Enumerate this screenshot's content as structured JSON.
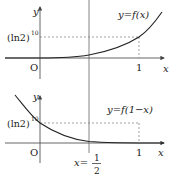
{
  "top_graph": {
    "curve_label": "y=f(x)",
    "y_axis_label": "y",
    "x_axis_label": "x",
    "origin_label": "O",
    "x_tick_label": "1",
    "y_tick_label_base": "(ln2)",
    "y_tick_label_exp": "10"
  },
  "bottom_graph": {
    "curve_label": "y=f(1−x)",
    "y_axis_label": "y",
    "x_axis_label": "x",
    "origin_label": "O",
    "x_tick_label": "1",
    "y_tick_label_base": "(ln2)",
    "y_tick_label_exp": "10"
  },
  "symmetry_line": {
    "label_lhs": "x=",
    "label_num": "1",
    "label_den": "2"
  },
  "colors": {
    "ink": "#222222",
    "axis": "#555555",
    "dashed": "#777777"
  }
}
